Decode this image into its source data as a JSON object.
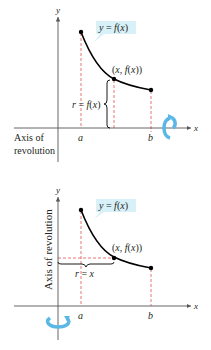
{
  "figure_top": {
    "axis_labels": {
      "x": "x",
      "y": "y"
    },
    "curve_label": "y = f(x)",
    "point_label": "(x, f(x))",
    "radius_label": "r = f(x)",
    "tick_labels": {
      "a": "a",
      "b": "b"
    },
    "axis_of_revolution_label_line1": "Axis of",
    "axis_of_revolution_label_line2": "revolution",
    "rotation_icon": "rotate-around-x-axis-icon"
  },
  "figure_bottom": {
    "axis_labels": {
      "x": "x",
      "y": "y"
    },
    "curve_label": "y = f(x)",
    "point_label": "(x, f(x))",
    "radius_label": "r = x",
    "tick_labels": {
      "a": "a",
      "b": "b"
    },
    "axis_of_revolution_label": "Axis of revolution",
    "rotation_icon": "rotate-around-y-axis-icon"
  },
  "colors": {
    "curve": "#000000",
    "axis": "#555555",
    "dashed": "#e0574f",
    "callout_bg": "#d8f0f8",
    "rotation_arrow": "#5bb8e6"
  }
}
